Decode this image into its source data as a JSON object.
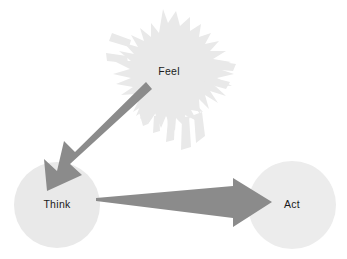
{
  "diagram": {
    "title": "Feel Think Act",
    "background_color": "#ffffff",
    "nodes": [
      {
        "id": "feel",
        "label": "Feel",
        "shape": "splat",
        "fill": "#e9e9e9",
        "center_x": 169,
        "center_y": 72
      },
      {
        "id": "think",
        "label": "Think",
        "shape": "circle",
        "fill": "#e9e9e9",
        "center_x": 57,
        "center_y": 205,
        "radius": 43
      },
      {
        "id": "act",
        "label": "Act",
        "shape": "circle",
        "fill": "#ececec",
        "center_x": 292,
        "center_y": 205,
        "radius": 44
      }
    ],
    "edges": [
      {
        "id": "feel-to-think",
        "from": "feel",
        "to": "think",
        "style": "tapered-arrow",
        "fill": "#8b8b8b",
        "direction": "down-left"
      },
      {
        "id": "think-to-act",
        "from": "think",
        "to": "act",
        "style": "tapered-arrow",
        "fill": "#8b8b8b",
        "direction": "right"
      }
    ]
  }
}
